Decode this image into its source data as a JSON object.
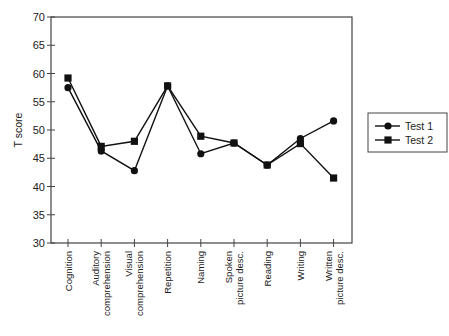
{
  "chart_data": {
    "type": "line",
    "title": "",
    "xlabel": "",
    "ylabel": "T score",
    "ylim": [
      30,
      70
    ],
    "yticks": [
      30,
      35,
      40,
      45,
      50,
      55,
      60,
      65,
      70
    ],
    "grid": false,
    "legend_position": "right",
    "categories": [
      [
        "Cognition"
      ],
      [
        "Auditory",
        "comprehension"
      ],
      [
        "Visual",
        "comprehension"
      ],
      [
        "Repetition"
      ],
      [
        "Naming"
      ],
      [
        "Spoken",
        "picture desc."
      ],
      [
        "Reading"
      ],
      [
        "Writing"
      ],
      [
        "Written",
        "picture desc."
      ]
    ],
    "series": [
      {
        "name": "Test 1",
        "marker": "circle",
        "values": [
          57.5,
          46.3,
          42.8,
          57.8,
          45.8,
          47.7,
          43.8,
          48.5,
          51.6
        ]
      },
      {
        "name": "Test 2",
        "marker": "square",
        "values": [
          59.2,
          47.1,
          48.0,
          57.8,
          48.9,
          47.7,
          43.8,
          47.6,
          41.5
        ]
      }
    ],
    "colors": {
      "line": "#111111",
      "axis": "#444444",
      "text": "#222222"
    }
  }
}
